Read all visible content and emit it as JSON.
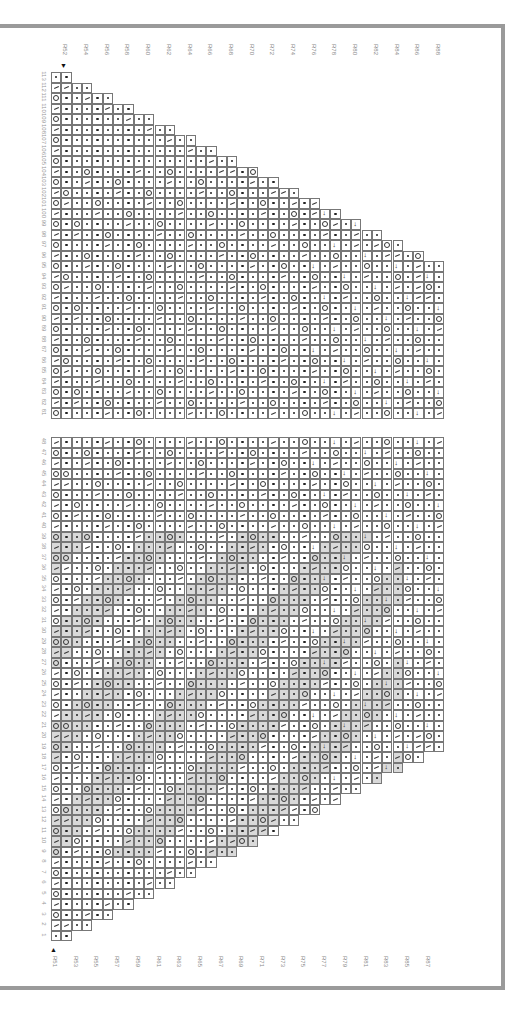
{
  "chart": {
    "orientation": "rotated-90",
    "top_row_labels": [
      "R52",
      "R54",
      "R56",
      "R58",
      "R60",
      "R62",
      "R64",
      "R66",
      "R68",
      "R70",
      "R72",
      "R74",
      "R76",
      "R78",
      "R80",
      "R82",
      "R84",
      "R86",
      "R88"
    ],
    "bottom_row_labels": [
      "R51",
      "R53",
      "R55",
      "R57",
      "R59",
      "R61",
      "R63",
      "R65",
      "R67",
      "R69",
      "R71",
      "R73",
      "R75",
      "R77",
      "R79",
      "R81",
      "R83",
      "R85",
      "R87"
    ],
    "top_arrow": "▼",
    "bottom_arrow": "▲",
    "upper_section_stitches": [
      113,
      112,
      111,
      110,
      109,
      108,
      107,
      106,
      105,
      104,
      103,
      102,
      101,
      100,
      99,
      98,
      97,
      96,
      95,
      94,
      93,
      92,
      91,
      90,
      89,
      88,
      87,
      86,
      85,
      84,
      83,
      82,
      81
    ],
    "lower_section_stitches": [
      48,
      47,
      46,
      45,
      44,
      43,
      42,
      41,
      40,
      39,
      38,
      37,
      36,
      35,
      34,
      33,
      32,
      31,
      30,
      29,
      28,
      27,
      26,
      25,
      24,
      23,
      22,
      21,
      20,
      19,
      18,
      17,
      16,
      15,
      14,
      13,
      12,
      11,
      10,
      9,
      8,
      7,
      6,
      5,
      4,
      3,
      2,
      1
    ],
    "symbols": {
      "knit": "dot",
      "yarn_over": "circle",
      "k2tog": "slash",
      "decrease_arrow": "→"
    },
    "colors": {
      "frame": "#9a9a9a",
      "grid_line": "#777777",
      "shade": "#d9d9d9"
    }
  }
}
